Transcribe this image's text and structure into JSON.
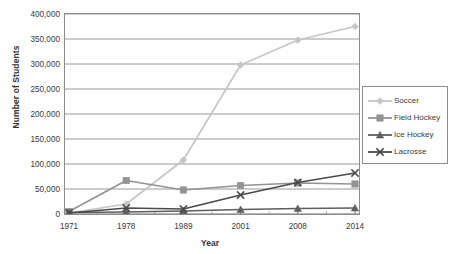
{
  "chart_data": {
    "type": "line",
    "title": "",
    "xlabel": "Year",
    "ylabel": "Number of Students",
    "categories": [
      "1971",
      "1978",
      "1989",
      "2001",
      "2008",
      "2014"
    ],
    "x": [
      1971,
      1978,
      1989,
      2001,
      2008,
      2014
    ],
    "ylim": [
      0,
      400000
    ],
    "ytick_values": [
      0,
      50000,
      100000,
      150000,
      200000,
      250000,
      300000,
      350000,
      400000
    ],
    "ytick_labels": [
      "0",
      "50,000",
      "100,000",
      "150,000",
      "200,000",
      "250,000",
      "300,000",
      "350,000",
      "400,000"
    ],
    "grid": "horizontal",
    "legend_position": "right",
    "series": [
      {
        "name": "Soccer",
        "values": [
          2000,
          20000,
          108000,
          298000,
          348000,
          375000
        ],
        "color": "#c6c6c6",
        "marker": "diamond"
      },
      {
        "name": "Field Hockey",
        "values": [
          5000,
          67000,
          48000,
          57000,
          62000,
          60000
        ],
        "color": "#939393",
        "marker": "square"
      },
      {
        "name": "Ice Hockey",
        "values": [
          3000,
          4000,
          6000,
          9000,
          11000,
          12000
        ],
        "color": "#5e5e5e",
        "marker": "triangle"
      },
      {
        "name": "Lacrosse",
        "values": [
          2000,
          12000,
          10000,
          38000,
          63000,
          82000
        ],
        "color": "#4a4a4a",
        "marker": "x"
      }
    ]
  },
  "legend": {
    "items": [
      {
        "label": "Soccer"
      },
      {
        "label": "Field Hockey"
      },
      {
        "label": "Ice Hockey"
      },
      {
        "label": "Lacrosse"
      }
    ]
  }
}
